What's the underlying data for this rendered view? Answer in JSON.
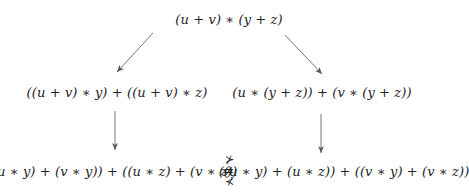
{
  "diagram": {
    "root": {
      "label": "(u + v) ∗ (y + z)"
    },
    "left_step": {
      "label": "((u + v) ∗ y) + ((u + v) ∗ z)"
    },
    "right_step": {
      "label": "(u ∗ (y + z)) + (v ∗ (y + z))"
    },
    "left_result": {
      "label": "((u ∗ y) + (v ∗ y)) + ((u ∗ z) + (v ∗ z))"
    },
    "right_result": {
      "label": "((u ∗ y) + (u ∗ z)) + ((v ∗ y) + (v ∗ z))"
    },
    "comparison": {
      "top": "⊁",
      "middle": "≠",
      "bottom": "⊀"
    },
    "edges": [
      {
        "from": "root",
        "to": "left_step"
      },
      {
        "from": "root",
        "to": "right_step"
      },
      {
        "from": "left_step",
        "to": "left_result"
      },
      {
        "from": "right_step",
        "to": "right_result"
      }
    ],
    "arrow_color": "#666666"
  }
}
